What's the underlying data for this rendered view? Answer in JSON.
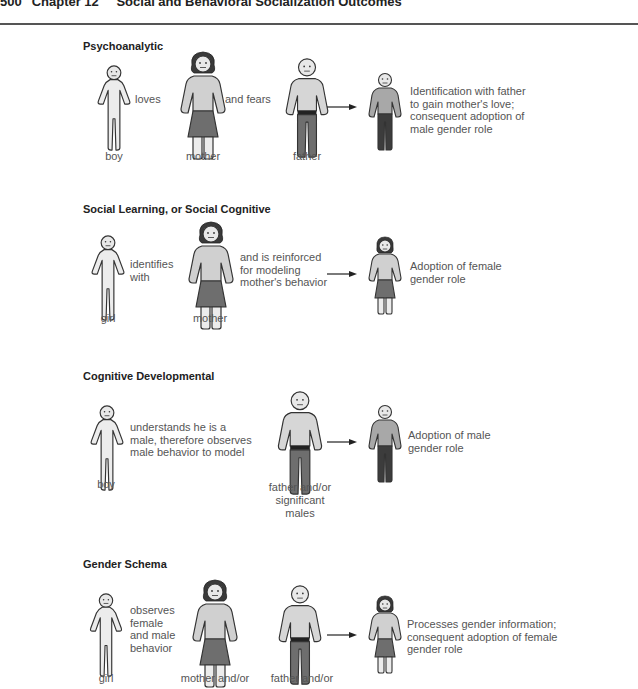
{
  "header": {
    "page_number": "500",
    "chapter": "Chapter 12",
    "title": "Social and Behavioral Socialization Outcomes"
  },
  "colors": {
    "outline": "#333333",
    "light_fill": "#e4e4e4",
    "shirt_fill": "#c8c8c8",
    "dark_fill": "#6e6e6e",
    "belt": "#222222",
    "text": "#555555"
  },
  "sections": [
    {
      "title": "Psychoanalytic",
      "figures": [
        {
          "type": "child-boy",
          "label": "boy"
        },
        {
          "type": "adult-female",
          "label": "mother"
        },
        {
          "type": "adult-male",
          "label": "father"
        },
        {
          "type": "child-male-outcome",
          "label": ""
        }
      ],
      "connectors": [
        "loves",
        "and fears"
      ],
      "outcome": "Identification with father\nto gain mother's love;\nconsequent adoption of\nmale gender role"
    },
    {
      "title": "Social Learning, or Social Cognitive",
      "figures": [
        {
          "type": "child-girl",
          "label": "girl"
        },
        {
          "type": "adult-female",
          "label": "mother"
        },
        {
          "type": "child-female-outcome",
          "label": ""
        }
      ],
      "connectors": [
        "identifies\nwith",
        "and is reinforced\nfor modeling\nmother's behavior"
      ],
      "outcome": "Adoption of female\ngender role"
    },
    {
      "title": "Cognitive Developmental",
      "figures": [
        {
          "type": "child-boy",
          "label": "boy"
        },
        {
          "type": "adult-male",
          "label": "father and/or\nsignificant\nmales"
        },
        {
          "type": "child-male-outcome",
          "label": ""
        }
      ],
      "connectors": [
        "understands he is a\nmale, therefore observes\nmale behavior to model"
      ],
      "outcome": "Adoption of male\ngender role"
    },
    {
      "title": "Gender Schema",
      "figures": [
        {
          "type": "child-girl",
          "label": "girl"
        },
        {
          "type": "adult-female",
          "label": "mother and/or"
        },
        {
          "type": "adult-male",
          "label": "father and/or"
        },
        {
          "type": "child-female-outcome",
          "label": ""
        }
      ],
      "connectors": [
        "observes\nfemale\nand male\nbehavior"
      ],
      "outcome": "Processes gender information;\nconsequent adoption of female\ngender role"
    }
  ]
}
